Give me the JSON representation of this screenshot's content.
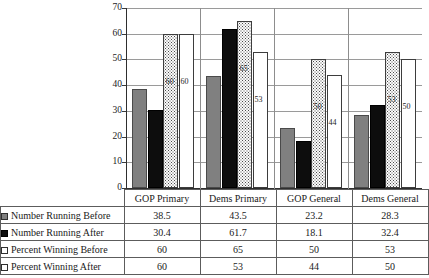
{
  "chart_data": {
    "type": "bar",
    "title": "",
    "xlabel": "",
    "ylabel": "",
    "ylim": [
      0,
      70
    ],
    "yticks": [
      0,
      10,
      20,
      30,
      40,
      50,
      60,
      70
    ],
    "ytick_labels": [
      "0",
      "10",
      "20",
      "30",
      "40",
      "50",
      "60",
      "70"
    ],
    "grid": true,
    "legend_position": "table-below",
    "categories": [
      "GOP Primary",
      "Dems Primary",
      "GOP General",
      "Dems General"
    ],
    "series": [
      {
        "name": "Number Running Before",
        "swatch": "gray-solid",
        "color": "#808080",
        "values": [
          38.5,
          43.5,
          23.2,
          28.3
        ],
        "value_labels": [
          "38.5",
          "43.5",
          "23.2",
          "28.3"
        ],
        "show_data_labels": false
      },
      {
        "name": "Number Running After",
        "swatch": "black-solid",
        "color": "#0d0d0d",
        "values": [
          30.4,
          61.7,
          18.1,
          32.4
        ],
        "value_labels": [
          "30.4",
          "61.7",
          "18.1",
          "32.4"
        ],
        "show_data_labels": false
      },
      {
        "name": "Percent Winning Before",
        "swatch": "white-dotted",
        "color": "#fbfbfb",
        "values": [
          60,
          65,
          50,
          53
        ],
        "value_labels": [
          "60",
          "65",
          "50",
          "53"
        ],
        "show_data_labels": true
      },
      {
        "name": "Percent Winning After",
        "swatch": "white-solid",
        "color": "#ffffff",
        "values": [
          60,
          53,
          44,
          50
        ],
        "value_labels": [
          "60",
          "53",
          "44",
          "50"
        ],
        "show_data_labels": true
      }
    ]
  },
  "table": {
    "corner_label": "",
    "column_headers": [
      "GOP Primary",
      "Dems Primary",
      "GOP General",
      "Dems General"
    ],
    "rows": [
      {
        "label": "Number Running Before",
        "swatch": "s0",
        "values": [
          "38.5",
          "43.5",
          "23.2",
          "28.3"
        ]
      },
      {
        "label": "Number Running After",
        "swatch": "s1",
        "values": [
          "30.4",
          "61.7",
          "18.1",
          "32.4"
        ]
      },
      {
        "label": "Percent Winning Before",
        "swatch": "s2",
        "values": [
          "60",
          "65",
          "50",
          "53"
        ]
      },
      {
        "label": "Percent Winning After",
        "swatch": "s3",
        "values": [
          "60",
          "53",
          "44",
          "50"
        ]
      }
    ]
  }
}
